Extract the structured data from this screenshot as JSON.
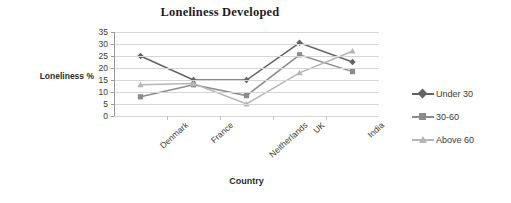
{
  "chart_data": {
    "type": "line",
    "title": "Loneliness Developed",
    "xlabel": "Country",
    "ylabel": "Loneliness %",
    "categories": [
      "Denmark",
      "France",
      "Neitherlands",
      "UK",
      "India"
    ],
    "ylim": [
      0,
      35
    ],
    "yticks": [
      0,
      5,
      10,
      15,
      20,
      25,
      30,
      35
    ],
    "grid": true,
    "legend_position": "right",
    "series": [
      {
        "name": "Under 30",
        "values": [
          25,
          15,
          15,
          30.5,
          22.5
        ],
        "color": "#636363",
        "marker": "diamond"
      },
      {
        "name": "30-60",
        "values": [
          8,
          13,
          8.5,
          25.5,
          18.5
        ],
        "color": "#8c8c8c",
        "marker": "square"
      },
      {
        "name": "Above 60",
        "values": [
          13,
          13.5,
          5,
          18,
          27
        ],
        "color": "#b5b5b5",
        "marker": "triangle"
      }
    ]
  },
  "axis": {
    "y_tick_labels": [
      "35",
      "30",
      "25",
      "20",
      "15",
      "10",
      "5",
      "0"
    ]
  },
  "legend": {
    "items": [
      {
        "label": "Under 30"
      },
      {
        "label": "30-60"
      },
      {
        "label": "Above 60"
      }
    ]
  }
}
